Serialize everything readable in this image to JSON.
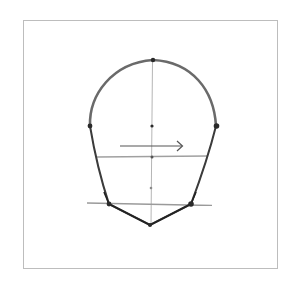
{
  "figure": {
    "description": "Pencil sketch of a front-view head outline with a vertical center line, horizontal guide lines, landmark dots and a rightward arrow"
  },
  "colors": {
    "background": "#ffffff",
    "frame": "#bdbdbd",
    "outline": "#333333",
    "guide": "#a8a8a8",
    "dot": "#2a2a2a",
    "arrow": "#555555"
  },
  "shapes": {
    "frame": {
      "x": 23,
      "y": 20,
      "w": 255,
      "h": 249
    },
    "center_line": {
      "x": 152,
      "y1": 60,
      "y2": 226
    },
    "guide_lines": [
      {
        "name": "brow-line",
        "x1": 90,
        "y1": 126,
        "x2": 216,
        "y2": 126
      },
      {
        "name": "nose-line",
        "x1": 97,
        "y1": 157,
        "x2": 208,
        "y2": 156
      },
      {
        "name": "jaw-line",
        "x1": 87,
        "y1": 203,
        "x2": 212,
        "y2": 205
      }
    ],
    "landmarks": [
      {
        "name": "crown-point",
        "x": 153,
        "y": 60
      },
      {
        "name": "left-temple-point",
        "x": 90,
        "y": 126
      },
      {
        "name": "center-point",
        "x": 152,
        "y": 126
      },
      {
        "name": "right-temple-point",
        "x": 216,
        "y": 126
      },
      {
        "name": "nose-point",
        "x": 152,
        "y": 157
      },
      {
        "name": "mouth-point",
        "x": 151,
        "y": 188
      },
      {
        "name": "left-jaw-point",
        "x": 109,
        "y": 204
      },
      {
        "name": "right-jaw-point",
        "x": 191,
        "y": 204
      },
      {
        "name": "chin-point",
        "x": 150,
        "y": 225
      }
    ],
    "arrow": {
      "x1": 120,
      "y1": 146,
      "x2": 182,
      "y2": 146,
      "direction": "right"
    }
  }
}
